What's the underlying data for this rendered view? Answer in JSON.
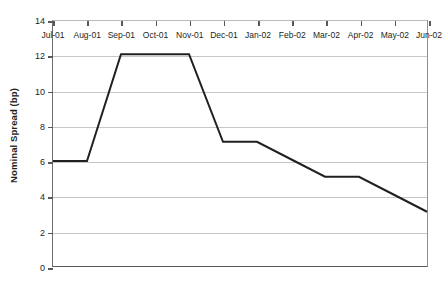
{
  "chart_data": {
    "type": "line",
    "title": "",
    "xlabel": "",
    "ylabel": "Nominal Spread (bp)",
    "ylim": [
      0,
      14
    ],
    "y_ticks": [
      0,
      2,
      4,
      6,
      8,
      10,
      12,
      14
    ],
    "grid": true,
    "legend": "none",
    "line_color": "#231f20",
    "categories": [
      "Jul-01",
      "Aug-01",
      "Sep-01",
      "Oct-01",
      "Nov-01",
      "Dec-01",
      "Jan-02",
      "Feb-02",
      "Mar-02",
      "Apr-02",
      "May-02",
      "Jun-02"
    ],
    "values": [
      6,
      6,
      12.1,
      12.1,
      12.1,
      7.1,
      7.1,
      6.1,
      5.1,
      5.1,
      4.1,
      3.1
    ],
    "series": [
      {
        "name": "Nominal Spread",
        "values": [
          6,
          6,
          12.1,
          12.1,
          12.1,
          7.1,
          7.1,
          6.1,
          5.1,
          5.1,
          4.1,
          3.1
        ]
      }
    ]
  }
}
